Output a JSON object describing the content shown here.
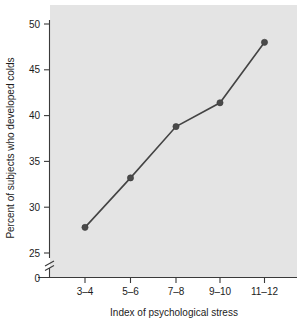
{
  "chart_data": {
    "type": "line",
    "title": "",
    "xlabel": "Index of psychological stress",
    "ylabel": "Percent of subjects who developed colds",
    "categories": [
      "3–4",
      "5–6",
      "7–8",
      "9–10",
      "11–12"
    ],
    "values": [
      27.8,
      33.2,
      38.8,
      41.4,
      48.0
    ],
    "series": [
      {
        "name": "Percent who developed colds",
        "values": [
          27.8,
          33.2,
          38.8,
          41.4,
          48.0
        ]
      }
    ],
    "ylim": [
      25,
      50
    ],
    "y_ticks": [
      25,
      30,
      35,
      40,
      45,
      50
    ],
    "y_tick_labels": [
      "25",
      "30",
      "35",
      "40",
      "45",
      "50"
    ],
    "y_origin_label": "0",
    "y_axis_break": true,
    "grid": false,
    "legend": "none",
    "plot_background_color": "#e4e4e4",
    "line_color": "#444444",
    "marker_color": "#4a4a4a",
    "axis_color": "#3a3a3a"
  },
  "axis": {
    "y_label": "Percent of subjects who developed colds",
    "x_label": "Index of psychological stress",
    "y_ticks": [
      "50",
      "45",
      "40",
      "35",
      "30",
      "25",
      "0"
    ],
    "x_ticks": [
      "3–4",
      "5–6",
      "7–8",
      "9–10",
      "11–12"
    ]
  }
}
